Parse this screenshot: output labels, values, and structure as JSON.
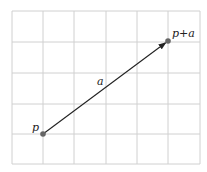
{
  "diagram": {
    "grid": {
      "x_lines": [
        12,
        43,
        74,
        106,
        137,
        168,
        200
      ],
      "y_lines": [
        11,
        42,
        73,
        104,
        134,
        164
      ],
      "color": "#d0d0d0"
    },
    "points": {
      "p": {
        "x": 43,
        "y": 134,
        "label": "p"
      },
      "p_plus_a": {
        "x": 168,
        "y": 41,
        "label": "p+a"
      }
    },
    "vector": {
      "label": "a",
      "color": "#222222"
    },
    "point_color": "#666666"
  }
}
